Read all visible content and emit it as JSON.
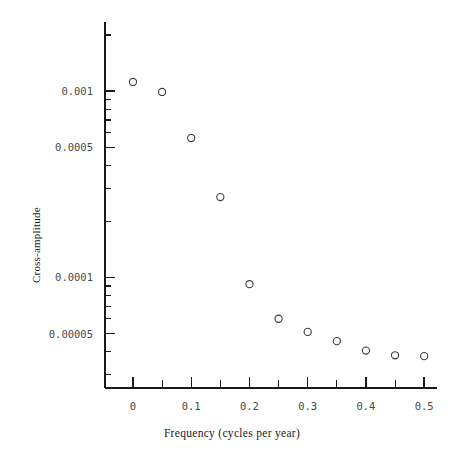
{
  "chart_data": {
    "type": "scatter",
    "title": "",
    "xlabel": "Frequency (cycles per year)",
    "ylabel": "Cross-amplitude",
    "xscale": "linear",
    "yscale": "log",
    "xlim": [
      -0.048,
      0.522
    ],
    "ylim": [
      2.55e-05,
      0.00235
    ],
    "grid": false,
    "legend": null,
    "marker": "open-circle",
    "x": [
      0.0,
      0.05,
      0.1,
      0.15,
      0.2,
      0.25,
      0.3,
      0.35,
      0.4,
      0.45,
      0.5
    ],
    "y": [
      0.00112,
      0.00099,
      0.00056,
      0.00027,
      9.2e-05,
      6e-05,
      5.1e-05,
      4.55e-05,
      4.05e-05,
      3.82e-05,
      3.78e-05
    ],
    "xticks": [
      0,
      0.05,
      0.1,
      0.15,
      0.2,
      0.25,
      0.3,
      0.35,
      0.4,
      0.45,
      0.5
    ],
    "xtick_labels": [
      "0",
      "",
      "0.1",
      "",
      "0.2",
      "",
      "0.3",
      "",
      "0.4",
      "",
      "0.5"
    ],
    "yticks": [
      0.001,
      0.0005,
      0.0001,
      5e-05
    ],
    "ytick_labels": [
      "0.001",
      "0.0005",
      "0.0001",
      "0.00005"
    ],
    "yminor_ticks": [
      0.002,
      0.0009,
      0.0008,
      0.0007,
      0.0006,
      0.0004,
      0.0003,
      0.0002,
      9e-05,
      8e-05,
      7e-05,
      6e-05,
      4e-05,
      3e-05
    ],
    "axis_color": "#1a1a1a",
    "marker_color": "#3c3c3c",
    "background": "#ffffff"
  }
}
